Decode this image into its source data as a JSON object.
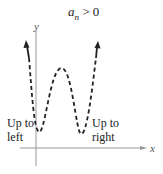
{
  "title": {
    "var": "a",
    "subscript": "n",
    "relation": " > 0"
  },
  "axes": {
    "x_label": "x",
    "y_label": "y"
  },
  "annotations": {
    "left": [
      "Up to",
      "left"
    ],
    "right": [
      "Up to",
      "right"
    ]
  },
  "colors": {
    "curve": "#222222",
    "axis": "#888888",
    "text": "#222222"
  },
  "curve": {
    "style": "dashed",
    "end_behavior": "both ends rise (up to left, up to right)",
    "description": "Even-degree polynomial with positive leading coefficient: two local minima and one local maximum"
  }
}
